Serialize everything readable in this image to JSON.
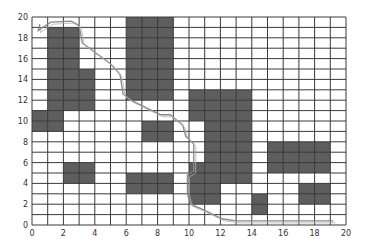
{
  "chart_data": {
    "type": "heatmap",
    "title": "",
    "xlabel": "",
    "ylabel": "",
    "xlim": [
      0,
      20
    ],
    "ylim": [
      0,
      20
    ],
    "grid": true,
    "grid_step": 1,
    "x_ticks": [
      "0",
      "2",
      "4",
      "6",
      "8",
      "10",
      "12",
      "14",
      "16",
      "18",
      "20"
    ],
    "y_ticks": [
      "0",
      "2",
      "4",
      "6",
      "8",
      "10",
      "12",
      "14",
      "16",
      "18",
      "20"
    ],
    "obstacles": [
      {
        "x0": 1,
        "x1": 3,
        "y0": 11,
        "y1": 19
      },
      {
        "x0": 3,
        "x1": 4,
        "y0": 11,
        "y1": 15
      },
      {
        "x0": 0,
        "x1": 2,
        "y0": 9,
        "y1": 11
      },
      {
        "x0": 2,
        "x1": 4,
        "y0": 4,
        "y1": 6
      },
      {
        "x0": 6,
        "x1": 9,
        "y0": 12,
        "y1": 20
      },
      {
        "x0": 7,
        "x1": 9,
        "y0": 8,
        "y1": 10
      },
      {
        "x0": 6,
        "x1": 9,
        "y0": 3,
        "y1": 5
      },
      {
        "x0": 10,
        "x1": 14,
        "y0": 10,
        "y1": 13
      },
      {
        "x0": 11,
        "x1": 14,
        "y0": 4,
        "y1": 10
      },
      {
        "x0": 10,
        "x1": 11,
        "y0": 2,
        "y1": 6
      },
      {
        "x0": 11,
        "x1": 12,
        "y0": 2,
        "y1": 4
      },
      {
        "x0": 14,
        "x1": 15,
        "y0": 1,
        "y1": 3
      },
      {
        "x0": 15,
        "x1": 19,
        "y0": 5,
        "y1": 8
      },
      {
        "x0": 17,
        "x1": 19,
        "y0": 2,
        "y1": 4
      }
    ],
    "path": {
      "name": "planned-path",
      "x": [
        0.5,
        0.4,
        1.2,
        2.5,
        3.0,
        3.2,
        5.0,
        5.6,
        5.8,
        6.3,
        8.2,
        8.8,
        9.6,
        9.8,
        10.3,
        10.3,
        9.9,
        9.9,
        10.1,
        11.0,
        12.1,
        13.0,
        19.2
      ],
      "y": [
        19.3,
        18.7,
        19.5,
        19.6,
        19.2,
        17.5,
        15.5,
        14.5,
        12.6,
        12.0,
        10.6,
        10.6,
        9.6,
        8.5,
        7.8,
        5.2,
        4.8,
        3.0,
        2.0,
        1.4,
        0.6,
        0.4,
        0.4
      ]
    },
    "colors": {
      "obstacle": "#5e5e5e",
      "grid": "#3a3a3a",
      "background": "#ffffff",
      "path": "#888888"
    }
  }
}
